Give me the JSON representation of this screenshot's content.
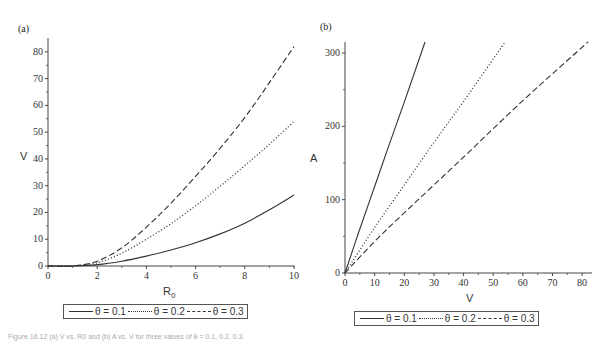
{
  "chart_data": [
    {
      "panel": "(a)",
      "type": "line",
      "title": "",
      "xlabel": "R0",
      "ylabel": "V",
      "xlim": [
        0,
        10
      ],
      "ylim": [
        0,
        82
      ],
      "xticks": [
        0,
        2,
        4,
        6,
        8,
        10
      ],
      "yticks": [
        0,
        10,
        20,
        30,
        40,
        50,
        60,
        70,
        80
      ],
      "grid": false,
      "legend_position": "bottom",
      "x": [
        0,
        1,
        2,
        3,
        4,
        5,
        6,
        7,
        8,
        9,
        10
      ],
      "series": [
        {
          "name": "θ = 0.1",
          "style": "solid",
          "values": [
            0,
            0,
            0.5,
            1.8,
            3.7,
            6.0,
            8.7,
            12.0,
            16.0,
            21.0,
            26.5
          ]
        },
        {
          "name": "θ = 0.2",
          "style": "dotted",
          "values": [
            0,
            0,
            1.2,
            4.8,
            10.0,
            15.8,
            22.5,
            29.8,
            37.5,
            45.5,
            54.0
          ]
        },
        {
          "name": "θ = 0.3",
          "style": "dashed",
          "values": [
            0,
            0,
            1.8,
            6.8,
            14.5,
            23.5,
            33.5,
            44.0,
            55.5,
            68.5,
            82.0
          ]
        }
      ]
    },
    {
      "panel": "(b)",
      "type": "line",
      "title": "",
      "xlabel": "V",
      "ylabel": "A",
      "xlim": [
        0,
        83
      ],
      "ylim": [
        0,
        315
      ],
      "xticks": [
        0,
        10,
        20,
        30,
        40,
        50,
        60,
        70,
        80
      ],
      "yticks": [
        0,
        100,
        200,
        300
      ],
      "grid": false,
      "legend_position": "bottom",
      "series": [
        {
          "name": "θ = 0.1",
          "style": "solid",
          "x": [
            0,
            5,
            10,
            15,
            20,
            27
          ],
          "values": [
            0,
            60,
            118,
            176,
            233,
            315
          ]
        },
        {
          "name": "θ = 0.2",
          "style": "dotted",
          "x": [
            0,
            10,
            20,
            30,
            40,
            54
          ],
          "values": [
            0,
            62,
            120,
            178,
            234,
            315
          ]
        },
        {
          "name": "θ = 0.3",
          "style": "dashed",
          "x": [
            0,
            10,
            20,
            40,
            60,
            82
          ],
          "values": [
            0,
            43,
            82,
            158,
            235,
            315
          ]
        }
      ]
    }
  ],
  "panels": {
    "a": {
      "label": "(a)",
      "xlabel": "R",
      "xlabel_sub": "0",
      "ylabel": "V"
    },
    "b": {
      "label": "(b)",
      "xlabel": "V",
      "ylabel": "A"
    }
  },
  "legend": {
    "items": [
      "θ = 0.1",
      "θ = 0.2",
      "θ = 0.3"
    ]
  },
  "caption": "Figure 16.12 (a) V vs. R0 and (b) A vs. V for three values of θ = 0.1, 0.2, 0.3."
}
